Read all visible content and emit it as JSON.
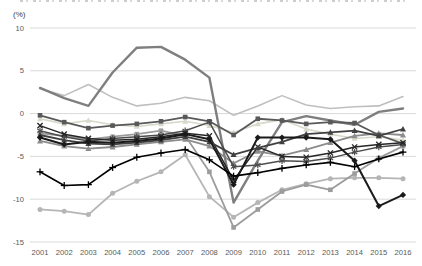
{
  "chart_data": {
    "type": "line",
    "title": "",
    "unit_label": "(%)",
    "xlabel": "",
    "ylabel": "",
    "x": [
      2001,
      2002,
      2003,
      2004,
      2005,
      2006,
      2007,
      2008,
      2009,
      2010,
      2011,
      2012,
      2013,
      2014,
      2015,
      2016
    ],
    "ylim": [
      -15,
      10
    ],
    "yticks": [
      10,
      5,
      0,
      -5,
      -10,
      -15
    ],
    "grid": true,
    "legend": "none",
    "grid_color": "#d9d9d9",
    "tick_color": "#595959",
    "series": [
      {
        "name": "gray-circle-line",
        "color": "#b5b5b5",
        "width": 1.8,
        "marker": "circle",
        "values": [
          -11.2,
          -11.4,
          -11.8,
          -9.3,
          -7.9,
          -6.8,
          -4.8,
          -9.7,
          -12.1,
          -10.4,
          -8.9,
          -8.2,
          -7.6,
          -7.5,
          -7.5,
          -7.6
        ]
      },
      {
        "name": "pale-triangle-line",
        "color": "#d8d8cb",
        "width": 1.6,
        "marker": "triangle",
        "values": [
          -0.6,
          -1.2,
          -0.8,
          -1.3,
          -1.5,
          -1.2,
          -0.9,
          -1.4,
          -2.2,
          -1.2,
          -0.7,
          -1.8,
          -2.4,
          -2.9,
          -2.7,
          -3.1
        ]
      },
      {
        "name": "light-gray-line",
        "color": "#bfbfbf",
        "width": 1.6,
        "marker": "none",
        "values": [
          2.9,
          2.1,
          3.4,
          1.9,
          0.9,
          1.2,
          1.9,
          1.5,
          -0.2,
          0.9,
          2.1,
          1.0,
          0.6,
          0.8,
          0.9,
          2.0
        ]
      },
      {
        "name": "gray-square-line",
        "color": "#9c9c9c",
        "width": 1.8,
        "marker": "square",
        "values": [
          -2.3,
          -2.6,
          -3.0,
          -2.7,
          -2.4,
          -2.0,
          -2.6,
          -6.8,
          -13.3,
          -11.2,
          -9.1,
          -8.3,
          -8.9,
          -7.0,
          -5.2,
          -3.8
        ]
      },
      {
        "name": "gray-triangle-line",
        "color": "#8c8c8c",
        "width": 1.8,
        "marker": "triangle",
        "values": [
          -3.2,
          -3.8,
          -4.1,
          -3.9,
          -3.6,
          -3.3,
          -3.0,
          -3.8,
          -5.8,
          -4.4,
          -4.9,
          -4.2,
          -3.4,
          -2.6,
          -2.3,
          -2.5
        ]
      },
      {
        "name": "thick-gray-line",
        "color": "#7f7f7f",
        "width": 2.4,
        "marker": "none",
        "values": [
          3.0,
          1.8,
          0.9,
          4.8,
          7.7,
          7.8,
          6.3,
          4.2,
          -10.4,
          -5.5,
          -1.0,
          -0.3,
          -0.8,
          -1.3,
          0.2,
          0.6
        ]
      },
      {
        "name": "dark-square-line",
        "color": "#595959",
        "width": 1.8,
        "marker": "square",
        "values": [
          -0.2,
          -1.0,
          -1.7,
          -1.4,
          -1.2,
          -0.9,
          -0.4,
          -0.9,
          -2.5,
          -0.6,
          -0.8,
          -1.2,
          -1.0,
          -1.1,
          -2.5,
          -3.5
        ]
      },
      {
        "name": "asterisk-line",
        "color": "#4d4d4d",
        "width": 1.5,
        "marker": "asterisk",
        "values": [
          -2.0,
          -2.7,
          -3.2,
          -2.9,
          -2.7,
          -2.5,
          -2.0,
          -1.0,
          -6.2,
          -6.0,
          -5.5,
          -5.6,
          -5.2,
          -4.5,
          -3.9,
          -3.6
        ]
      },
      {
        "name": "black-x-line",
        "color": "#262626",
        "width": 1.5,
        "marker": "x",
        "values": [
          -1.4,
          -2.4,
          -2.9,
          -3.1,
          -3.0,
          -2.7,
          -2.3,
          -2.6,
          -7.8,
          -3.9,
          -5.0,
          -5.1,
          -4.6,
          -3.9,
          -3.6,
          -3.4
        ]
      },
      {
        "name": "dark-triangle-line",
        "color": "#404040",
        "width": 1.8,
        "marker": "triangle",
        "values": [
          -2.5,
          -3.1,
          -3.5,
          -3.6,
          -3.4,
          -3.1,
          -2.7,
          -3.3,
          -4.8,
          -4.0,
          -3.3,
          -2.4,
          -2.2,
          -2.0,
          -2.6,
          -1.8
        ]
      },
      {
        "name": "black-diamond-line",
        "color": "#1a1a1a",
        "width": 2.0,
        "marker": "diamond",
        "values": [
          -2.8,
          -3.6,
          -3.3,
          -3.4,
          -3.2,
          -2.9,
          -2.4,
          -3.0,
          -8.3,
          -2.8,
          -2.8,
          -2.8,
          -3.0,
          -5.5,
          -10.8,
          -9.5
        ]
      },
      {
        "name": "black-plus-line",
        "color": "#000000",
        "width": 1.6,
        "marker": "plus",
        "values": [
          -6.8,
          -8.4,
          -8.3,
          -6.3,
          -5.1,
          -4.6,
          -4.2,
          -5.4,
          -7.3,
          -6.9,
          -6.4,
          -6.0,
          -5.7,
          -6.2,
          -5.3,
          -4.5
        ]
      }
    ]
  }
}
